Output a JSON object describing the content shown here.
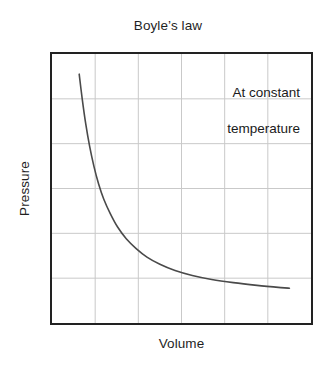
{
  "chart_data": {
    "type": "line",
    "title": "Boyle’s law",
    "xlabel": "Volume",
    "ylabel": "Pressure",
    "annotation_lines": [
      "At constant",
      "temperature"
    ],
    "annotation_text": "At constant temperature",
    "relationship": "P = k / V  (inverse proportionality, hyperbola)",
    "grid": true,
    "grid_columns": 6,
    "grid_rows": 6,
    "x_gridline_fractions": [
      0.1667,
      0.3333,
      0.5,
      0.6667,
      0.8333
    ],
    "y_gridline_fractions": [
      0.1667,
      0.3333,
      0.5,
      0.6667,
      0.8333
    ],
    "xlim": [
      0,
      6
    ],
    "ylim": [
      0,
      6
    ],
    "x_tick_labels": [],
    "y_tick_labels": [],
    "legend": null,
    "series": [
      {
        "name": "Pressure vs Volume",
        "color": "#4a4a4a",
        "x": [
          0.63,
          0.7,
          0.78,
          0.87,
          0.97,
          1.08,
          1.2,
          1.35,
          1.52,
          1.72,
          1.95,
          2.2,
          2.5,
          2.85,
          3.25,
          3.7,
          4.2,
          4.75,
          5.3,
          5.5
        ],
        "y": [
          5.55,
          5.0,
          4.45,
          3.95,
          3.5,
          3.1,
          2.76,
          2.44,
          2.14,
          1.88,
          1.66,
          1.47,
          1.31,
          1.17,
          1.06,
          0.97,
          0.9,
          0.84,
          0.79,
          0.775
        ]
      }
    ]
  },
  "colors": {
    "background": "#ffffff",
    "frame": "#222222",
    "gridline": "#c9c9c9",
    "curve": "#4a4a4a",
    "text": "#1f1f1f"
  }
}
